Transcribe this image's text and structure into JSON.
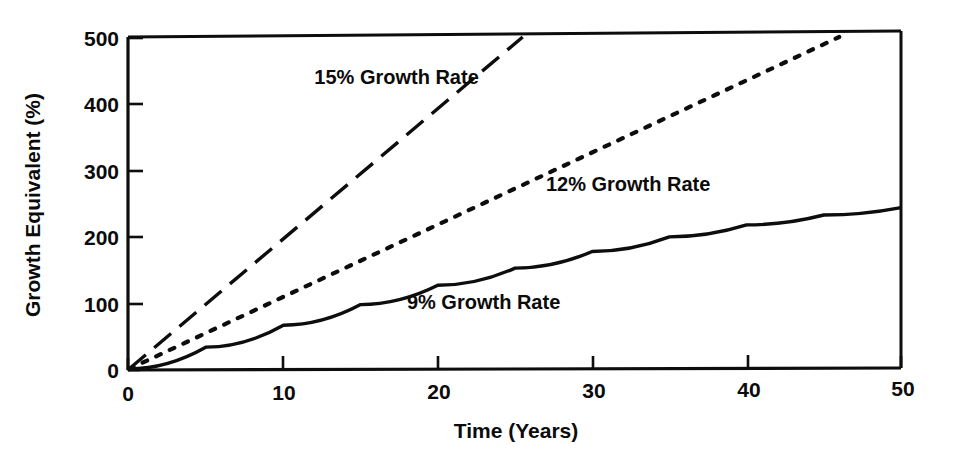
{
  "chart_data": {
    "type": "line",
    "title": "",
    "xlabel": "Time (Years)",
    "ylabel": "Growth Equivalent (%)",
    "xlim": [
      0,
      50
    ],
    "ylim": [
      0,
      500
    ],
    "xticks": [
      0,
      10,
      20,
      30,
      40,
      50
    ],
    "yticks": [
      0,
      100,
      200,
      300,
      400,
      500
    ],
    "xtick_labels": [
      "0",
      "10",
      "20",
      "30",
      "40",
      "50"
    ],
    "ytick_labels": [
      "0",
      "100",
      "200",
      "300",
      "400",
      "500"
    ],
    "grid": false,
    "legend_position": "inline-annotations",
    "series": [
      {
        "name": "15% Growth Rate",
        "label": "15% Growth Rate",
        "linestyle": "long-dash",
        "color": "#0d0d0d",
        "x": [
          0,
          5,
          10,
          15,
          20,
          25.5
        ],
        "values": [
          0,
          98,
          196,
          294,
          392,
          500
        ],
        "clipped_at_top": true,
        "label_x": 12.0,
        "label_y": 430
      },
      {
        "name": "12% Growth Rate",
        "label": "12% Growth Rate",
        "linestyle": "dotted",
        "color": "#0d0d0d",
        "x": [
          0,
          10,
          20,
          30,
          40,
          46
        ],
        "values": [
          0,
          109,
          218,
          326,
          435,
          500
        ],
        "clipped_at_top": true,
        "label_x": 27.0,
        "label_y": 268
      },
      {
        "name": "9% Growth Rate",
        "label": "9% Growth Rate",
        "linestyle": "solid",
        "color": "#0d0d0d",
        "x": [
          0,
          5,
          10,
          15,
          20,
          25,
          30,
          35,
          40,
          45,
          50
        ],
        "values": [
          0,
          33,
          66,
          97,
          126,
          152,
          177,
          199,
          217,
          232,
          243
        ],
        "clipped_at_top": false,
        "label_x": 18.0,
        "label_y": 90
      }
    ]
  },
  "figure": {
    "tick_count_x": 6,
    "tick_count_y": 6,
    "background": "#ffffff",
    "axis_color": "#0d0d0d"
  }
}
